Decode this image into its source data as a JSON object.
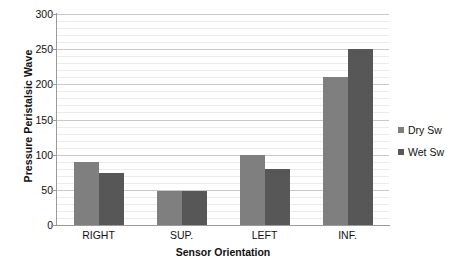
{
  "chart_data": {
    "type": "bar",
    "title": "",
    "xlabel": "Sensor Orientation",
    "ylabel": "Pressure Peristalsic Wave",
    "categories": [
      "RIGHT",
      "SUP.",
      "LEFT",
      "INF."
    ],
    "series": [
      {
        "name": "Dry Sw",
        "color": "#7f7f7f",
        "values": [
          89,
          49,
          100,
          210
        ]
      },
      {
        "name": "Wet Sw",
        "color": "#575757",
        "values": [
          74,
          49,
          79,
          250
        ]
      }
    ],
    "ylim": [
      0,
      300
    ],
    "ytick_labels": [
      "0",
      "50",
      "100",
      "150",
      "200",
      "250",
      "300"
    ],
    "ytick_values": [
      0,
      50,
      100,
      150,
      200,
      250,
      300
    ],
    "minor_tick_step": 10,
    "grid": true,
    "grid_orientation": "horizontal",
    "legend_position": "right",
    "plot_background": "#ffffff",
    "gridline_minor_color": "#eceaea",
    "gridline_major_color": "#c9c9c9",
    "axis_color": "#9a9a9a"
  }
}
